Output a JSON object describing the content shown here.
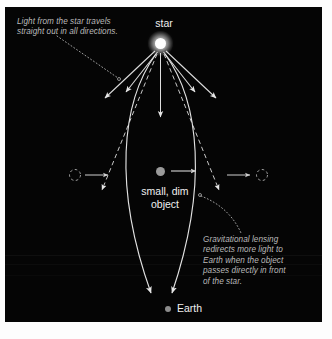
{
  "figure": {
    "background_color": "#fdfdfd",
    "panel_color": "#050505",
    "accent_color": "#ffffff",
    "annotation_color": "#b9b9b9",
    "label_color": "#efefef"
  },
  "labels": {
    "star": "star",
    "object": "small, dim\nobject",
    "earth": "Earth"
  },
  "annotations": {
    "top_left": "Light from the star travels\nstraight out in all directions.",
    "bottom_right": "Gravitational lensing\nredirects more light to\nEarth when the object\npasses directly in front\nof the star."
  },
  "caption": {
    "text": ""
  },
  "diagram_data": {
    "type": "diagram",
    "subject": "gravitational microlensing",
    "bodies": [
      {
        "name": "star",
        "role": "light-source",
        "color": "#ffffff",
        "x": 155,
        "y": 36,
        "radius": 5.5
      },
      {
        "name": "small, dim object",
        "role": "lens",
        "color": "#9a9a9a",
        "x": 155,
        "y": 164,
        "radius": 4.5
      },
      {
        "name": "Earth",
        "role": "observer",
        "color": "#8c8c8c",
        "x": 163,
        "y": 302,
        "radius": 3
      }
    ],
    "straight_rays": [
      {
        "name": "ray-far-left",
        "from": [
          150,
          44
        ],
        "to": [
          100,
          92
        ]
      },
      {
        "name": "ray-left",
        "from": [
          152,
          45
        ],
        "to": [
          120,
          86
        ]
      },
      {
        "name": "ray-center",
        "from": [
          155,
          46
        ],
        "to": [
          155,
          112
        ]
      },
      {
        "name": "ray-right",
        "from": [
          159,
          45
        ],
        "to": [
          190,
          86
        ]
      },
      {
        "name": "ray-far-right",
        "from": [
          161,
          44
        ],
        "to": [
          210,
          92
        ]
      }
    ],
    "dashed_deflected_rays": [
      {
        "name": "dashed-ray-left",
        "from": [
          152,
          46
        ],
        "to": [
          95,
          185
        ]
      },
      {
        "name": "dashed-ray-right",
        "from": [
          159,
          46
        ],
        "to": [
          216,
          185
        ]
      }
    ],
    "curved_lensed_rays": [
      {
        "name": "curved-ray-left",
        "from": [
          152,
          46
        ],
        "control": [
          110,
          170
        ],
        "to": [
          147,
          290
        ]
      },
      {
        "name": "curved-ray-right",
        "from": [
          159,
          46
        ],
        "control": [
          201,
          170
        ],
        "to": [
          166,
          290
        ]
      }
    ],
    "motion_markers": [
      {
        "name": "object-ghost-left",
        "x": 70,
        "y": 168,
        "style": "dashed-circle"
      },
      {
        "name": "object-motion-arrow-left",
        "from": [
          80,
          168
        ],
        "to": [
          105,
          168
        ]
      },
      {
        "name": "object-motion-arrow-center",
        "from": [
          165,
          164
        ],
        "to": [
          193,
          164
        ]
      },
      {
        "name": "object-motion-arrow-right",
        "from": [
          222,
          168
        ],
        "to": [
          247,
          168
        ]
      },
      {
        "name": "object-ghost-right",
        "x": 257,
        "y": 168,
        "style": "dashed-circle"
      }
    ],
    "leader_lines": [
      {
        "name": "leader-top-left",
        "style": "dotted",
        "from": [
          55,
          32
        ],
        "to": [
          113,
          72
        ]
      },
      {
        "name": "leader-bottom-right",
        "style": "dotted",
        "from": [
          196,
          190
        ],
        "to": [
          236,
          228
        ]
      }
    ]
  }
}
